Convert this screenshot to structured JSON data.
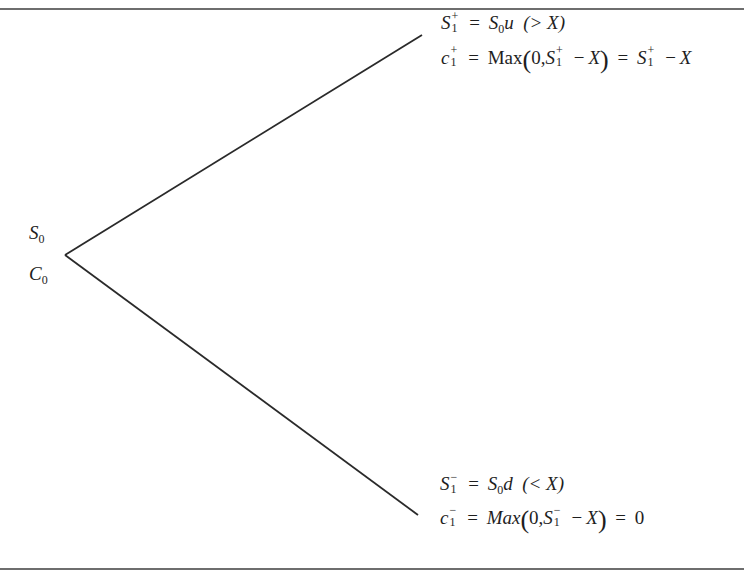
{
  "diagram": {
    "type": "one-period binomial tree",
    "root": {
      "stock_label": "S",
      "stock_sub": "0",
      "call_label": "C",
      "call_sub": "0"
    },
    "up_node": {
      "line1": {
        "lhs_var": "S",
        "lhs_sup": "+",
        "lhs_sub": "1",
        "eq": "=",
        "rhs_var": "S",
        "rhs_sub": "0",
        "rhs_factor": "u",
        "condition": "(> X)"
      },
      "line2": {
        "lhs_var": "c",
        "lhs_sup": "+",
        "lhs_sub": "1",
        "eq": "=",
        "func": "Max",
        "arg_zero": "0,",
        "arg_var": "S",
        "arg_sup": "+",
        "arg_sub": "1",
        "arg_minus": "−",
        "arg_strike": "X",
        "eq2": "=",
        "res_var": "S",
        "res_sup": "+",
        "res_sub": "1",
        "res_minus": "−",
        "res_strike": "X"
      }
    },
    "down_node": {
      "line1": {
        "lhs_var": "S",
        "lhs_sup": "−",
        "lhs_sub": "1",
        "eq": "=",
        "rhs_var": "S",
        "rhs_sub": "0",
        "rhs_factor": "d",
        "condition": "(< X)"
      },
      "line2": {
        "lhs_var": "c",
        "lhs_sup": "−",
        "lhs_sub": "1",
        "eq": "=",
        "func": "Max",
        "arg_zero": "0,",
        "arg_var": "S",
        "arg_sup": "−",
        "arg_sub": "1",
        "arg_minus": "−",
        "arg_strike": "X",
        "eq2": "=",
        "result": "0"
      }
    },
    "edges": [
      {
        "from": "root",
        "to": "up_node",
        "x1": 65,
        "y1": 255,
        "x2": 422,
        "y2": 35
      },
      {
        "from": "root",
        "to": "down_node",
        "x1": 65,
        "y1": 255,
        "x2": 418,
        "y2": 515
      }
    ],
    "colors": {
      "line": "#2a2a2a",
      "text": "#1e1e1e",
      "rule": "#6e6e6e"
    }
  }
}
